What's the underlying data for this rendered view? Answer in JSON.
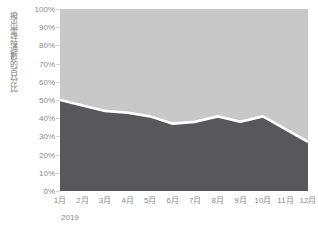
{
  "chart_data": {
    "type": "area",
    "stacked": true,
    "title": "",
    "subtitle": "",
    "xlabel": "2019",
    "ylabel": "撥出電話通數的百分比",
    "categories": [
      "1月",
      "2月",
      "3月",
      "4月",
      "5月",
      "6月",
      "7月",
      "8月",
      "9月",
      "10月",
      "11月",
      "12月"
    ],
    "series": [
      {
        "name": "lower-area",
        "color": "#58585c",
        "values": [
          50,
          47,
          44,
          43,
          41,
          37,
          38,
          41,
          38,
          41,
          34,
          27
        ]
      },
      {
        "name": "upper-area",
        "color": "#c8c8c8",
        "values": [
          50,
          53,
          56,
          57,
          59,
          63,
          62,
          59,
          62,
          59,
          66,
          73
        ]
      }
    ],
    "ylim": [
      0,
      100
    ],
    "ytick_labels": [
      "100%",
      "90%",
      "80%",
      "70%",
      "60%",
      "50%",
      "40%",
      "30%",
      "20%",
      "10%",
      "0%"
    ],
    "ytick_values": [
      100,
      90,
      80,
      70,
      60,
      50,
      40,
      30,
      20,
      10,
      0
    ],
    "grid": true,
    "legend": "none",
    "boundary_line_color": "#ffffff"
  },
  "axis": {
    "y_title": "撥出電話通數的百分比",
    "x_caption": "2019"
  },
  "colors": {
    "upper_fill": "#c8c8c8",
    "lower_fill": "#58585c",
    "divider": "#ffffff",
    "gridline": "#d6d6d6",
    "tick_text": "#8a8a8a"
  }
}
